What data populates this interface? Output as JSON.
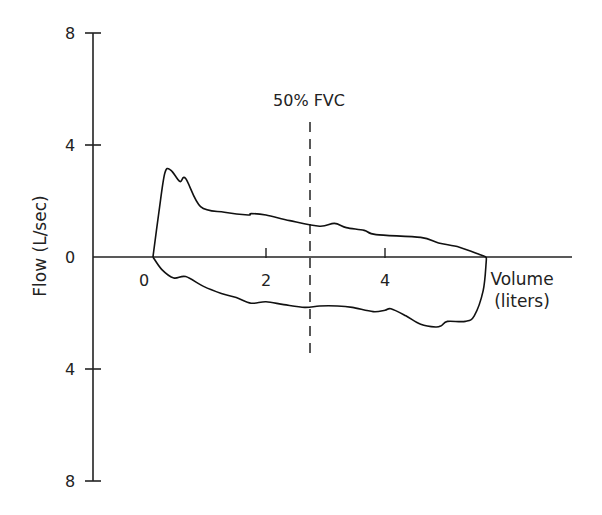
{
  "chart_data": {
    "type": "line",
    "title": "",
    "xlabel": "Volume (liters)",
    "xlabel_lines": [
      "Volume",
      "(liters)"
    ],
    "ylabel": "Flow (L/sec)",
    "x_ticks": [
      {
        "value": 0,
        "label": "0"
      },
      {
        "value": 2,
        "label": "2"
      },
      {
        "value": 4,
        "label": "4"
      }
    ],
    "y_ticks": [
      {
        "value": 8,
        "label": "8"
      },
      {
        "value": 4,
        "label": "4"
      },
      {
        "value": 0,
        "label": "0"
      },
      {
        "value": -4,
        "label": "4"
      },
      {
        "value": -8,
        "label": "8"
      }
    ],
    "xlim": [
      -1.8,
      7.6
    ],
    "ylim": [
      -8,
      8
    ],
    "annotations": [
      {
        "text": "50% FVC",
        "x": 2.9,
        "style": "dashed-vertical-line"
      }
    ],
    "series": [
      {
        "name": "Expiratory limb",
        "points": [
          [
            0.1,
            0
          ],
          [
            0.2,
            1.6
          ],
          [
            0.3,
            3.0
          ],
          [
            0.4,
            3.1
          ],
          [
            0.55,
            2.7
          ],
          [
            0.65,
            2.8
          ],
          [
            0.9,
            1.8
          ],
          [
            1.3,
            1.6
          ],
          [
            1.7,
            1.5
          ],
          [
            1.75,
            1.55
          ],
          [
            2.0,
            1.5
          ],
          [
            2.4,
            1.3
          ],
          [
            2.9,
            1.1
          ],
          [
            3.15,
            1.2
          ],
          [
            3.35,
            1.05
          ],
          [
            3.65,
            0.95
          ],
          [
            3.85,
            0.8
          ],
          [
            4.6,
            0.7
          ],
          [
            4.9,
            0.5
          ],
          [
            5.25,
            0.35
          ],
          [
            5.6,
            0.08
          ],
          [
            5.7,
            0
          ]
        ]
      },
      {
        "name": "Inspiratory limb",
        "points": [
          [
            0.1,
            0
          ],
          [
            0.25,
            -0.45
          ],
          [
            0.45,
            -0.75
          ],
          [
            0.65,
            -0.7
          ],
          [
            0.95,
            -1.05
          ],
          [
            1.25,
            -1.3
          ],
          [
            1.5,
            -1.45
          ],
          [
            1.75,
            -1.65
          ],
          [
            2.0,
            -1.6
          ],
          [
            2.3,
            -1.7
          ],
          [
            2.65,
            -1.8
          ],
          [
            2.9,
            -1.75
          ],
          [
            3.2,
            -1.75
          ],
          [
            3.45,
            -1.8
          ],
          [
            3.8,
            -1.95
          ],
          [
            4.0,
            -1.9
          ],
          [
            4.1,
            -1.85
          ],
          [
            4.35,
            -2.1
          ],
          [
            4.6,
            -2.4
          ],
          [
            4.85,
            -2.5
          ],
          [
            4.95,
            -2.45
          ],
          [
            5.05,
            -2.3
          ],
          [
            5.35,
            -2.3
          ],
          [
            5.5,
            -2.1
          ],
          [
            5.65,
            -1.2
          ],
          [
            5.7,
            -0.2
          ],
          [
            5.7,
            0
          ]
        ]
      }
    ],
    "grid": false,
    "legend": null
  }
}
